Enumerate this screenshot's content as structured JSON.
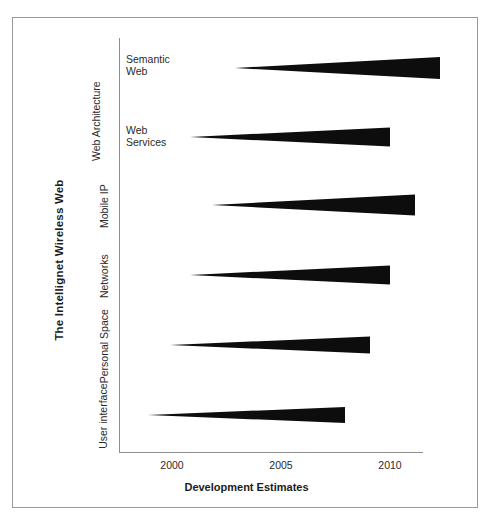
{
  "figure": {
    "ylabel": "The Intellignet Wireless Web",
    "xlabel": "Development Estimates"
  },
  "xticks": [
    {
      "label": "2000",
      "x": 172
    },
    {
      "label": "2005",
      "x": 281
    },
    {
      "label": "2010",
      "x": 390
    }
  ],
  "groups": [
    {
      "label": "Web\nArchitecture"
    }
  ],
  "categories": [
    {
      "label": "Semantic\nWeb"
    },
    {
      "label": "Web\nServices"
    },
    {
      "label": "Mobile\nIP"
    },
    {
      "label": "Networks"
    },
    {
      "label": "Personal\nSpace"
    },
    {
      "label": "User\ninterface"
    }
  ],
  "chart_data": {
    "type": "bar",
    "title": "",
    "subtitle": "",
    "xlabel": "Development Estimates",
    "ylabel": "The Intellignet Wireless Web",
    "xlim": [
      1998,
      2013
    ],
    "xticks": [
      2000,
      2005,
      2010
    ],
    "grid": false,
    "legend": null,
    "note": "Horizontal wedge/triangle bars: each wedge tapers from a point at the start year (zero thickness) to full thickness at the end year, indicating ramping development intensity over a time span.",
    "bar_color": "#0d0d0d",
    "categories": [
      "Semantic Web",
      "Web Services",
      "Mobile IP",
      "Networks",
      "Personal Space",
      "User interface"
    ],
    "group": "Web Architecture",
    "group_members": [
      "Semantic Web",
      "Web Services"
    ],
    "series": [
      {
        "name": "start_year",
        "values": [
          2002.9,
          2000.8,
          2001.8,
          2000.8,
          1999.9,
          1998.9
        ]
      },
      {
        "name": "end_year",
        "values": [
          2012.3,
          2010.0,
          2011.1,
          2010.0,
          2009.1,
          2008.0
        ]
      },
      {
        "name": "span_years",
        "values": [
          9.4,
          9.2,
          9.3,
          9.2,
          9.2,
          9.1
        ]
      }
    ],
    "bars": [
      {
        "category": "Semantic Web",
        "start_year": 2002.9,
        "end_year": 2012.3,
        "x_start_px": 235,
        "x_end_px": 440,
        "y_center_px": 68,
        "thickness_px": 22
      },
      {
        "category": "Web Services",
        "start_year": 2000.8,
        "end_year": 2010.0,
        "x_start_px": 190,
        "x_end_px": 390,
        "y_center_px": 137,
        "thickness_px": 19
      },
      {
        "category": "Mobile IP",
        "start_year": 2001.8,
        "end_year": 2011.1,
        "x_start_px": 212,
        "x_end_px": 415,
        "y_center_px": 205,
        "thickness_px": 21
      },
      {
        "category": "Networks",
        "start_year": 2000.8,
        "end_year": 2010.0,
        "x_start_px": 190,
        "x_end_px": 390,
        "y_center_px": 275,
        "thickness_px": 19
      },
      {
        "category": "Personal Space",
        "start_year": 1999.9,
        "end_year": 2009.1,
        "x_start_px": 170,
        "x_end_px": 370,
        "y_center_px": 345,
        "thickness_px": 17
      },
      {
        "category": "User interface",
        "start_year": 1998.9,
        "end_year": 2008.0,
        "x_start_px": 148,
        "x_end_px": 345,
        "y_center_px": 415,
        "thickness_px": 16
      }
    ]
  }
}
